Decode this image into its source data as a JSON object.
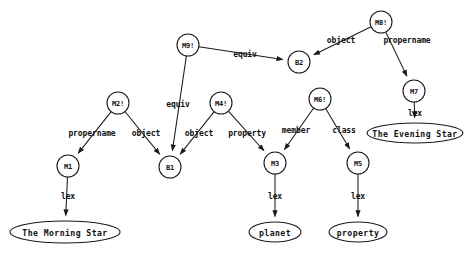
{
  "diagram": {
    "type": "semantic-network",
    "canvas": {
      "width": 469,
      "height": 259,
      "background": "#ffffff"
    },
    "stroke_color": "#1a1a1a",
    "nodes": [
      {
        "id": "M9",
        "label": "M9!",
        "shape": "circle",
        "cx": 188,
        "cy": 45,
        "r": 11
      },
      {
        "id": "M8",
        "label": "M8!",
        "shape": "circle",
        "cx": 381,
        "cy": 22,
        "r": 11
      },
      {
        "id": "B2",
        "label": "B2",
        "shape": "circle",
        "cx": 299,
        "cy": 62,
        "r": 11
      },
      {
        "id": "M7",
        "label": "M7",
        "shape": "circle",
        "cx": 414,
        "cy": 91,
        "r": 11
      },
      {
        "id": "M2",
        "label": "M2!",
        "shape": "circle",
        "cx": 118,
        "cy": 103,
        "r": 11
      },
      {
        "id": "M4",
        "label": "M4!",
        "shape": "circle",
        "cx": 221,
        "cy": 103,
        "r": 11
      },
      {
        "id": "M6",
        "label": "M6!",
        "shape": "circle",
        "cx": 320,
        "cy": 99,
        "r": 11
      },
      {
        "id": "M1",
        "label": "M1",
        "shape": "circle",
        "cx": 68,
        "cy": 166,
        "r": 11
      },
      {
        "id": "B1",
        "label": "B1",
        "shape": "circle",
        "cx": 170,
        "cy": 167,
        "r": 11
      },
      {
        "id": "M3",
        "label": "M3",
        "shape": "circle",
        "cx": 275,
        "cy": 163,
        "r": 11
      },
      {
        "id": "M5",
        "label": "M5",
        "shape": "circle",
        "cx": 358,
        "cy": 163,
        "r": 11
      },
      {
        "id": "morning-star",
        "label": "The Morning Star",
        "shape": "ellipse",
        "cx": 65,
        "cy": 232,
        "rx": 55,
        "ry": 11
      },
      {
        "id": "evening-star",
        "label": "The Evening Star",
        "shape": "ellipse",
        "cx": 415,
        "cy": 133,
        "rx": 48,
        "ry": 10
      },
      {
        "id": "planet",
        "label": "planet",
        "shape": "ellipse",
        "cx": 275,
        "cy": 232,
        "rx": 26,
        "ry": 10
      },
      {
        "id": "property-leaf",
        "label": "property",
        "shape": "ellipse",
        "cx": 358,
        "cy": 232,
        "rx": 29,
        "ry": 10
      }
    ],
    "edges": [
      {
        "from": "M9",
        "to": "B2",
        "label": "equiv",
        "lx": 245,
        "ly": 54,
        "arrow": true
      },
      {
        "from": "M9",
        "to": "B1",
        "label": "equiv",
        "lx": 178,
        "ly": 104,
        "arrow": true
      },
      {
        "from": "M8",
        "to": "B2",
        "label": "object",
        "lx": 341,
        "ly": 40,
        "arrow": true
      },
      {
        "from": "M8",
        "to": "M7",
        "label": "propername",
        "lx": 407,
        "ly": 40,
        "arrow": true
      },
      {
        "from": "M7",
        "to": "evening-star",
        "label": "lex",
        "lx": 415,
        "ly": 113,
        "arrow": true
      },
      {
        "from": "M2",
        "to": "M1",
        "label": "propername",
        "lx": 92,
        "ly": 133,
        "arrow": true
      },
      {
        "from": "M2",
        "to": "B1",
        "label": "object",
        "lx": 146,
        "ly": 133,
        "arrow": true
      },
      {
        "from": "M4",
        "to": "B1",
        "label": "object",
        "lx": 199,
        "ly": 133,
        "arrow": true
      },
      {
        "from": "M4",
        "to": "M3",
        "label": "property",
        "lx": 247,
        "ly": 133,
        "arrow": true
      },
      {
        "from": "M6",
        "to": "M3",
        "label": "member",
        "lx": 296,
        "ly": 130,
        "arrow": true
      },
      {
        "from": "M6",
        "to": "M5",
        "label": "class",
        "lx": 344,
        "ly": 130,
        "arrow": true
      },
      {
        "from": "M1",
        "to": "morning-star",
        "label": "lex",
        "lx": 68,
        "ly": 196,
        "arrow": true
      },
      {
        "from": "M3",
        "to": "planet",
        "label": "lex",
        "lx": 275,
        "ly": 196,
        "arrow": true
      },
      {
        "from": "M5",
        "to": "property-leaf",
        "label": "lex",
        "lx": 358,
        "ly": 196,
        "arrow": true
      }
    ]
  }
}
